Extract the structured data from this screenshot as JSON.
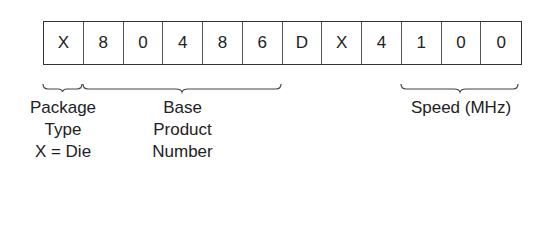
{
  "cells": [
    "X",
    "8",
    "0",
    "4",
    "8",
    "6",
    "D",
    "X",
    "4",
    "1",
    "0",
    "0"
  ],
  "labels": {
    "package": [
      "Package",
      "Type",
      "X = Die"
    ],
    "base": [
      "Base",
      "Product",
      "Number"
    ],
    "speed": [
      "Speed (MHz)"
    ]
  }
}
